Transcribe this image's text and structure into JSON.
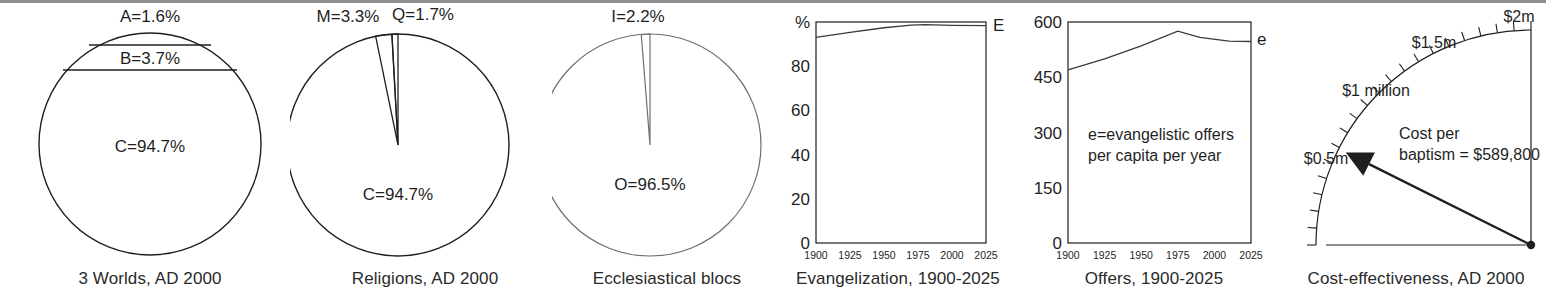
{
  "figure": {
    "panel_count": 6,
    "background": "#ffffff",
    "rule_color": "#8d8d8d",
    "line_color": "#1f1f1f",
    "faint_line_color": "#6e6e6e"
  },
  "panels": {
    "worlds": {
      "caption": "3 Worlds, AD 2000",
      "labels": {
        "a": "A=1.6%",
        "b": "B=3.7%",
        "c": "C=94.7%"
      }
    },
    "religions": {
      "caption": "Religions, AD 2000",
      "labels": {
        "m": "M=3.3%",
        "q": "Q=1.7%",
        "c": "C=94.7%"
      }
    },
    "blocs": {
      "caption": "Ecclesiastical blocs",
      "labels": {
        "i": "I=2.2%",
        "o": "O=96.5%"
      }
    },
    "evangelization": {
      "caption": "Evangelization, 1900-2025",
      "series_label": "E",
      "axis_unit": "%"
    },
    "offers": {
      "caption": "Offers, 1900-2025",
      "series_label": "e",
      "annotation_line1": "e=evangelistic offers",
      "annotation_line2": "per capita per year"
    },
    "cost": {
      "caption": "Cost-effectiveness, AD 2000",
      "dial_labels": {
        "half": "$0.5m",
        "one": "$1 million",
        "one_half": "$1.5m",
        "two": "$2m"
      },
      "readout_line1": "Cost per",
      "readout_line2": "baptism = $589,800"
    }
  },
  "chart_data": [
    {
      "type": "pie",
      "id": "worlds",
      "title": "3 Worlds, AD 2000",
      "variant": "horizontal-band-circle",
      "labels": [
        "A",
        "B",
        "C"
      ],
      "values": [
        1.6,
        3.7,
        94.7
      ],
      "data_labels": [
        "A=1.6%",
        "B=3.7%",
        "C=94.7%"
      ],
      "legend": "none"
    },
    {
      "type": "pie",
      "id": "religions",
      "title": "Religions, AD 2000",
      "labels": [
        "M",
        "Q",
        "C"
      ],
      "values": [
        3.3,
        1.7,
        94.7
      ],
      "data_labels": [
        "M=3.3%",
        "Q=1.7%",
        "C=94.7%"
      ],
      "start_angle_deg": -90,
      "legend": "none"
    },
    {
      "type": "pie",
      "id": "blocs",
      "title": "Ecclesiastical blocs",
      "labels": [
        "I",
        "O"
      ],
      "values": [
        2.2,
        96.5
      ],
      "data_labels": [
        "I=2.2%",
        "O=96.5%"
      ],
      "start_angle_deg": -90,
      "legend": "none"
    },
    {
      "type": "line",
      "id": "evangelization",
      "title": "Evangelization, 1900-2025",
      "xlabel": "",
      "ylabel": "%",
      "xlim": [
        1900,
        2025
      ],
      "ylim": [
        0,
        100
      ],
      "xticks": [
        1900,
        1925,
        1950,
        1975,
        2000,
        2025
      ],
      "yticks": [
        0,
        20,
        40,
        60,
        80
      ],
      "ytick_labels": [
        "0",
        "20",
        "40",
        "60",
        "80"
      ],
      "grid": false,
      "series": [
        {
          "name": "E",
          "x": [
            1900,
            1925,
            1950,
            1970,
            1980,
            2000,
            2025
          ],
          "values": [
            93.0,
            95.3,
            97.4,
            98.6,
            98.8,
            98.5,
            98.4
          ]
        }
      ]
    },
    {
      "type": "line",
      "id": "offers",
      "title": "Offers, 1900-2025",
      "xlabel": "",
      "ylabel": "",
      "xlim": [
        1900,
        2025
      ],
      "ylim": [
        0,
        600
      ],
      "xticks": [
        1900,
        1925,
        1950,
        1975,
        2000,
        2025
      ],
      "yticks": [
        0,
        150,
        300,
        450,
        600
      ],
      "ytick_labels": [
        "0",
        "150",
        "300",
        "450",
        "600"
      ],
      "grid": false,
      "annotation": "e=evangelistic offers per capita per year",
      "series": [
        {
          "name": "e",
          "x": [
            1900,
            1925,
            1950,
            1975,
            1990,
            2010,
            2025
          ],
          "values": [
            470,
            500,
            535,
            575,
            558,
            548,
            547
          ]
        }
      ]
    },
    {
      "type": "gauge",
      "id": "cost",
      "title": "Cost-effectiveness, AD 2000",
      "scale_min": 0,
      "scale_max": 2000000,
      "tick_labels": [
        "$0.5m",
        "$1 million",
        "$1.5m",
        "$2m"
      ],
      "tick_values": [
        500000,
        1000000,
        1500000,
        2000000
      ],
      "value": 589800,
      "value_label": "Cost per baptism = $589,800"
    }
  ]
}
